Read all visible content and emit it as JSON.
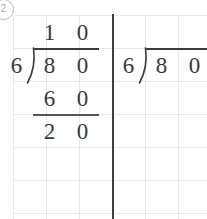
{
  "worksheet": {
    "problem_number": "2",
    "marker_icon": "circled-number-icon",
    "grid": {
      "cell_size_px": 33,
      "columns": 6,
      "rows": 6,
      "line_color": "#e7e7ea",
      "background": "#ffffff"
    },
    "divider": {
      "icon": "vertical-divider-icon",
      "color": "#3e3e44"
    }
  },
  "problems": [
    {
      "id": "worked-example",
      "label": "Worked long division example",
      "divisor": "6",
      "dividend": [
        "8",
        "0"
      ],
      "quotient": [
        "1",
        "0"
      ],
      "steps": [
        {
          "name": "partial-product",
          "digits": [
            "6",
            "0"
          ]
        },
        {
          "name": "remainder",
          "digits": [
            "2",
            "0"
          ]
        }
      ],
      "has_subtraction_rule": true
    },
    {
      "id": "blank-practice",
      "label": "Blank long division practice problem",
      "divisor": "6",
      "dividend": [
        "8",
        "0"
      ],
      "quotient": [],
      "steps": [],
      "has_subtraction_rule": false
    }
  ]
}
